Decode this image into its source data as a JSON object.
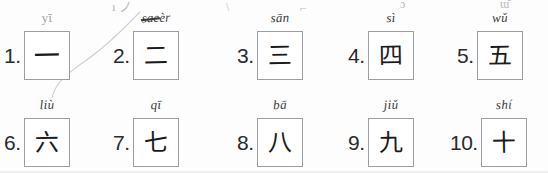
{
  "document": {
    "kind": "handwritten-worksheet",
    "title": "Chinese numerals 1-10 practice worksheet",
    "top_cut_marks": [
      {
        "text": "ı  ノ",
        "x": 112,
        "y": -4,
        "size": 13
      },
      {
        "text": "\\",
        "x": 226,
        "y": 0,
        "size": 12
      },
      {
        "text": "⌐",
        "x": 300,
        "y": 1,
        "size": 12
      },
      {
        "text": "ɔ̀",
        "x": 400,
        "y": -3,
        "size": 12
      },
      {
        "text": "ɯ̆",
        "x": 500,
        "y": -3,
        "size": 12
      }
    ]
  },
  "items": [
    {
      "number": "1.",
      "pinyin": "yī",
      "pinyin_faint": true,
      "pinyin_struck": false,
      "character": "一",
      "char_size": 26,
      "x": 4,
      "y": 31,
      "box_w": 46,
      "box_h": 49
    },
    {
      "number": "2.",
      "pinyin_prefix": "sae",
      "pinyin": "èr",
      "pinyin_faint": false,
      "pinyin_struck": true,
      "character": "二",
      "char_size": 24,
      "x": 113,
      "y": 31,
      "box_w": 46,
      "box_h": 49
    },
    {
      "number": "3.",
      "pinyin": "sān",
      "pinyin_faint": false,
      "pinyin_struck": false,
      "character": "三",
      "char_size": 24,
      "x": 237,
      "y": 31,
      "box_w": 46,
      "box_h": 49
    },
    {
      "number": "4.",
      "pinyin": "sì",
      "pinyin_faint": false,
      "pinyin_struck": false,
      "character": "四",
      "char_size": 24,
      "x": 348,
      "y": 31,
      "box_w": 46,
      "box_h": 49
    },
    {
      "number": "5.",
      "pinyin": "wǔ",
      "pinyin_faint": false,
      "pinyin_struck": false,
      "character": "五",
      "char_size": 24,
      "x": 457,
      "y": 31,
      "box_w": 46,
      "box_h": 49
    },
    {
      "number": "6.",
      "pinyin": "liù",
      "pinyin_faint": false,
      "pinyin_struck": false,
      "character": "六",
      "char_size": 24,
      "x": 4,
      "y": 118,
      "box_w": 46,
      "box_h": 49
    },
    {
      "number": "7.",
      "pinyin": "qī",
      "pinyin_faint": false,
      "pinyin_struck": false,
      "character": "七",
      "char_size": 24,
      "x": 113,
      "y": 118,
      "box_w": 46,
      "box_h": 49
    },
    {
      "number": "8.",
      "pinyin": "bā",
      "pinyin_faint": false,
      "pinyin_struck": false,
      "character": "八",
      "char_size": 24,
      "x": 237,
      "y": 118,
      "box_w": 46,
      "box_h": 49
    },
    {
      "number": "9.",
      "pinyin": "jiǔ",
      "pinyin_faint": false,
      "pinyin_struck": false,
      "character": "九",
      "char_size": 24,
      "x": 348,
      "y": 118,
      "box_w": 46,
      "box_h": 49
    },
    {
      "number": "10.",
      "pinyin": "shí",
      "pinyin_faint": false,
      "pinyin_struck": false,
      "character": "十",
      "char_size": 24,
      "x": 450,
      "y": 118,
      "box_w": 46,
      "box_h": 49
    }
  ],
  "colors": {
    "ink": "#1b1b1b",
    "box_border": "#9b9fa3",
    "faint_pencil": "#c9ccd0",
    "paper": "#fdfdfd"
  }
}
